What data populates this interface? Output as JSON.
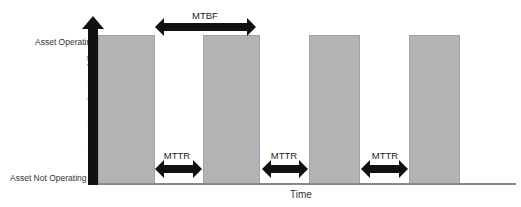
{
  "diagram": {
    "y_axis_title": "Asset Operating Capability",
    "x_axis_title": "Time",
    "y_levels": {
      "top": "Asset Operating",
      "bottom": "Asset Not Operating"
    },
    "bars": [
      {
        "label": "operating-period-1"
      },
      {
        "label": "operating-period-2"
      },
      {
        "label": "operating-period-3"
      },
      {
        "label": "operating-period-4"
      }
    ],
    "annotations": {
      "mtbf": "MTBF",
      "mttr": [
        "MTTR",
        "MTTR",
        "MTTR"
      ]
    },
    "colors": {
      "bar": "#b3b3b3",
      "axis": "#111111",
      "arrow": "#111111"
    }
  }
}
